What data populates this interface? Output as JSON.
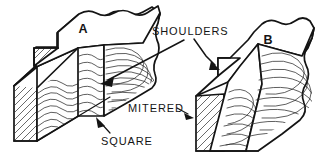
{
  "figure": {
    "background_color": "#ffffff",
    "line_color": "#141414",
    "width": 328,
    "height": 163
  },
  "labels": {
    "block_a": "A",
    "block_b": "B",
    "shoulders": "SHOULDERS",
    "square": "SQUARE",
    "mitered": "MITERED"
  },
  "annotations": [
    {
      "name": "shoulders-callout",
      "text": "SHOULDERS",
      "points_to": [
        "square-shoulder-face-block-a",
        "mitered-shoulder-face-block-b"
      ]
    },
    {
      "name": "square-callout",
      "text": "SQUARE",
      "points_to": "square-shoulder-block-a"
    },
    {
      "name": "mitered-callout",
      "text": "MITERED",
      "points_to": "mitered-shoulder-block-b"
    }
  ],
  "blocks": [
    {
      "name": "block-a",
      "label": "A",
      "shoulder_type": "square",
      "description": "Timber block with square-cut shoulder notch, wavy edge grain face and diagonally hatched end grain"
    },
    {
      "name": "block-b",
      "label": "B",
      "shoulder_type": "mitered",
      "description": "Timber block with mitered (angled) shoulder notch, wavy edge grain face and diagonally hatched end grain"
    }
  ]
}
